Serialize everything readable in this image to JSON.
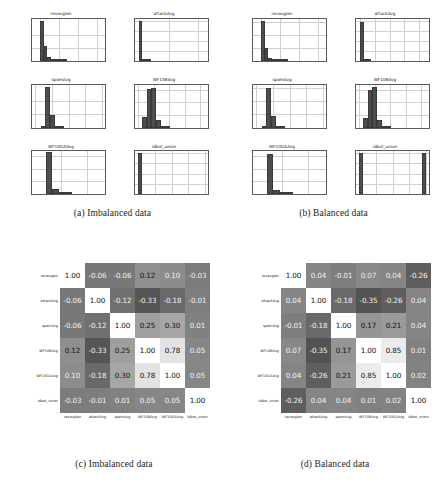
{
  "figure": {
    "background": "#ffffff",
    "bar_color": "#4d4d4d",
    "grid_color": "#d0d0d0",
    "axis_color": "#5a5a5a"
  },
  "panels": [
    {
      "id": "a",
      "caption": "(a) Imbalanced data"
    },
    {
      "id": "b",
      "caption": "(b) Balanced data"
    },
    {
      "id": "c",
      "caption": "(c) Imbalanced data"
    },
    {
      "id": "d",
      "caption": "(d) Balanced data"
    }
  ],
  "variables": [
    "revavglen",
    "attackAvg",
    "spamAvg",
    "WF10BAvg",
    "WF10GAAvg",
    "idbot_union"
  ],
  "chart_data": [
    {
      "id": "hist-imbalanced",
      "type": "bar",
      "title": "(a) Imbalanced data",
      "subplots": [
        {
          "title": "revavglen",
          "xlabel": "",
          "ylabel": "",
          "xlim": [
            -40000,
            340000
          ],
          "ylim": [
            0,
            32000
          ],
          "xticks": [
            0,
            100000,
            200000,
            300000
          ],
          "xticklabels": [
            "0",
            "100000",
            "200000",
            "300000"
          ],
          "yticks": [
            0,
            10000,
            20000
          ],
          "yticklabels": [
            "0",
            "10000",
            "20000"
          ],
          "bin_edges": [
            0,
            20000,
            40000,
            60000,
            80000,
            100000,
            120000,
            140000
          ],
          "values": [
            30000,
            11500,
            3000,
            1200,
            500,
            250,
            120
          ]
        },
        {
          "title": "attackAvg",
          "xlabel": "",
          "ylabel": "",
          "xlim": [
            -0.03,
            0.47
          ],
          "ylim": [
            0,
            42000
          ],
          "xticks": [
            0.0,
            0.2,
            0.4
          ],
          "xticklabels": [
            "0.0",
            "0.2",
            "0.4"
          ],
          "yticks": [
            0,
            10000,
            20000,
            30000,
            40000
          ],
          "yticklabels": [
            "0",
            "10000",
            "20000",
            "30000",
            "40000"
          ],
          "bin_edges": [
            0.0,
            0.02,
            0.04,
            0.06,
            0.08
          ],
          "values": [
            39500,
            900,
            200,
            80
          ]
        },
        {
          "title": "spamAvg",
          "xlabel": "",
          "ylabel": "",
          "xlim": [
            -0.05,
            1.05
          ],
          "ylim": [
            0,
            32000
          ],
          "xticks": [
            0.0,
            0.25,
            0.5,
            0.75,
            1.0
          ],
          "xticklabels": [
            "0.00",
            "0.25",
            "0.50",
            "0.75",
            "1.00"
          ],
          "yticks": [
            0,
            10000,
            20000
          ],
          "yticklabels": [
            "0",
            "10000",
            "20000"
          ],
          "bin_edges": [
            0.08,
            0.15,
            0.22,
            0.29,
            0.36,
            0.43
          ],
          "values": [
            1600,
            30500,
            9500,
            1400,
            300
          ]
        },
        {
          "title": "WF10BAvg",
          "xlabel": "",
          "ylabel": "",
          "xlim": [
            -0.04,
            0.9
          ],
          "ylim": [
            0,
            17000
          ],
          "xticks": [
            0.0,
            0.2,
            0.4,
            0.6,
            0.8
          ],
          "xticklabels": [
            "0.0",
            "0.2",
            "0.4",
            "0.6",
            "0.8"
          ],
          "yticks": [
            0,
            5000,
            10000,
            15000
          ],
          "yticklabels": [
            "0",
            "5000",
            "10000",
            "15000"
          ],
          "bin_edges": [
            0.05,
            0.11,
            0.17,
            0.23,
            0.29,
            0.35,
            0.41
          ],
          "values": [
            4200,
            15200,
            15800,
            3000,
            600,
            150
          ]
        },
        {
          "title": "WF10GAAvg",
          "xlabel": "",
          "ylabel": "",
          "xlim": [
            -0.0015,
            0.027
          ],
          "ylim": [
            0,
            34000
          ],
          "xticks": [
            0.01,
            0.02
          ],
          "xticklabels": [
            "0.01",
            "0.02"
          ],
          "yticks": [
            0,
            10000,
            20000,
            30000
          ],
          "yticklabels": [
            "0",
            "10000",
            "20000",
            "30000"
          ],
          "bin_edges": [
            0.004,
            0.0065,
            0.009,
            0.0115,
            0.014
          ],
          "values": [
            33000,
            3800,
            700,
            150
          ]
        },
        {
          "title": "idbot_union",
          "xlabel": "",
          "ylabel": "",
          "xlim": [
            -0.05,
            1.05
          ],
          "ylim": [
            0,
            42000
          ],
          "xticks": [
            0.0,
            0.25,
            0.5,
            0.75,
            1.0
          ],
          "xticklabels": [
            "0.00",
            "0.25",
            "0.50",
            "0.75",
            "1.00"
          ],
          "yticks": [
            0,
            10000,
            20000,
            30000,
            40000
          ],
          "yticklabels": [
            "0",
            "10000",
            "20000",
            "30000",
            "40000"
          ],
          "bin_edges": [
            0.0,
            0.05
          ],
          "values": [
            40000
          ]
        }
      ]
    },
    {
      "id": "hist-balanced",
      "type": "bar",
      "title": "(b) Balanced data",
      "subplots": [
        {
          "title": "revavglen",
          "xlabel": "",
          "ylabel": "",
          "xlim": [
            -40000,
            340000
          ],
          "ylim": [
            0,
            33000
          ],
          "xticks": [
            0,
            100000,
            200000,
            300000
          ],
          "xticklabels": [
            "0",
            "100000",
            "200000",
            "300000"
          ],
          "yticks": [
            0,
            10000,
            20000,
            30000
          ],
          "yticklabels": [
            "0",
            "10000",
            "20000",
            "30000"
          ],
          "bin_edges": [
            0,
            20000,
            40000,
            60000,
            80000,
            100000,
            120000,
            140000
          ],
          "values": [
            31000,
            10500,
            2800,
            1100,
            500,
            250,
            120
          ]
        },
        {
          "title": "attackAvg",
          "xlabel": "",
          "ylabel": "",
          "xlim": [
            -0.03,
            0.47
          ],
          "ylim": [
            0,
            42000
          ],
          "xticks": [
            0.0,
            0.1,
            0.2,
            0.3,
            0.4
          ],
          "xticklabels": [
            "0.0",
            "0.1",
            "0.2",
            "0.3",
            "0.4"
          ],
          "yticks": [
            0,
            10000,
            20000,
            30000,
            40000
          ],
          "yticklabels": [
            "0",
            "10000",
            "20000",
            "30000",
            "40000"
          ],
          "bin_edges": [
            0.0,
            0.025,
            0.05,
            0.075
          ],
          "values": [
            39000,
            1100,
            250
          ]
        },
        {
          "title": "spamAvg",
          "xlabel": "",
          "ylabel": "",
          "xlim": [
            -0.05,
            1.05
          ],
          "ylim": [
            0,
            32000
          ],
          "xticks": [
            0.0,
            0.25,
            0.5,
            0.75,
            1.0
          ],
          "xticklabels": [
            "0.00",
            "0.25",
            "0.50",
            "0.75",
            "1.00"
          ],
          "yticks": [
            0,
            10000,
            20000,
            30000
          ],
          "yticklabels": [
            "0",
            "10000",
            "20000",
            "30000"
          ],
          "bin_edges": [
            0.08,
            0.15,
            0.22,
            0.29,
            0.36,
            0.43
          ],
          "values": [
            1500,
            30000,
            9000,
            1300,
            280
          ]
        },
        {
          "title": "WF10BAvg",
          "xlabel": "",
          "ylabel": "",
          "xlim": [
            -0.04,
            0.9
          ],
          "ylim": [
            0,
            17000
          ],
          "xticks": [
            0.0,
            0.2,
            0.4,
            0.6,
            0.8
          ],
          "xticklabels": [
            "0.0",
            "0.2",
            "0.4",
            "0.6",
            "0.8"
          ],
          "yticks": [
            0,
            5000,
            10000,
            15000
          ],
          "yticklabels": [
            "0",
            "5000",
            "10000",
            "15000"
          ],
          "bin_edges": [
            0.05,
            0.11,
            0.17,
            0.23,
            0.29,
            0.35,
            0.41
          ],
          "values": [
            4000,
            14800,
            16000,
            3200,
            700,
            150
          ]
        },
        {
          "title": "WF10GAAvg",
          "xlabel": "",
          "ylabel": "",
          "xlim": [
            -0.0015,
            0.027
          ],
          "ylim": [
            0,
            34000
          ],
          "xticks": [
            0.01,
            0.02
          ],
          "xticklabels": [
            "0.01",
            "0.02"
          ],
          "yticks": [
            0,
            10000,
            20000,
            30000
          ],
          "yticklabels": [
            "0",
            "10000",
            "20000",
            "30000"
          ],
          "bin_edges": [
            0.004,
            0.0065,
            0.009,
            0.0115,
            0.014
          ],
          "values": [
            32000,
            3500,
            600,
            120
          ]
        },
        {
          "title": "idbot_union",
          "xlabel": "",
          "ylabel": "",
          "xlim": [
            -0.05,
            1.05
          ],
          "ylim": [
            0,
            21000
          ],
          "xticks": [
            0.0,
            0.25,
            0.5,
            0.75,
            1.0
          ],
          "xticklabels": [
            "0.00",
            "0.25",
            "0.50",
            "0.75",
            "1.00"
          ],
          "yticks": [
            0,
            5000,
            10000,
            15000,
            20000
          ],
          "yticklabels": [
            "0",
            "5000",
            "10000",
            "15000",
            "20000"
          ],
          "bin_edges": [
            0.0,
            0.05,
            0.95,
            1.0
          ],
          "values": [
            20000,
            0,
            20000
          ]
        }
      ]
    },
    {
      "id": "corr-imbalanced",
      "type": "heatmap",
      "title": "(c) Imbalanced data",
      "colormap": "gray",
      "vmin": -1.0,
      "vmax": 1.0,
      "xlabels": [
        "revavglen",
        "attackAvg",
        "spamAvg",
        "WF10BAvg",
        "WF10GAAvg",
        "idbot_union"
      ],
      "ylabels": [
        "revavglen",
        "attackAvg",
        "spamAvg",
        "WF10BAvg",
        "WF10GAAvg",
        "idbot_union"
      ],
      "matrix": [
        [
          1.0,
          -0.06,
          -0.06,
          0.12,
          0.1,
          -0.03
        ],
        [
          -0.06,
          1.0,
          -0.12,
          -0.33,
          -0.18,
          -0.01
        ],
        [
          -0.06,
          -0.12,
          1.0,
          0.25,
          0.3,
          0.01
        ],
        [
          0.12,
          -0.33,
          0.25,
          1.0,
          0.78,
          0.05
        ],
        [
          0.1,
          -0.18,
          0.3,
          0.78,
          1.0,
          0.05
        ],
        [
          -0.03,
          -0.01,
          0.01,
          0.05,
          0.05,
          1.0
        ]
      ]
    },
    {
      "id": "corr-balanced",
      "type": "heatmap",
      "title": "(d) Balanced data",
      "colormap": "gray",
      "vmin": -1.0,
      "vmax": 1.0,
      "xlabels": [
        "revavglen",
        "attackAvg",
        "spamAvg",
        "WF10BAvg",
        "WF10GAAvg",
        "idbot_union"
      ],
      "ylabels": [
        "revavglen",
        "attackAvg",
        "spamAvg",
        "WF10BAvg",
        "WF10GAAvg",
        "idbot_union"
      ],
      "matrix": [
        [
          1.0,
          0.04,
          -0.01,
          0.07,
          0.04,
          -0.26
        ],
        [
          0.04,
          1.0,
          -0.18,
          -0.35,
          -0.26,
          0.04
        ],
        [
          -0.01,
          -0.18,
          1.0,
          0.17,
          0.21,
          0.04
        ],
        [
          0.07,
          -0.35,
          0.17,
          1.0,
          0.85,
          0.01
        ],
        [
          0.04,
          -0.26,
          0.21,
          0.85,
          1.0,
          0.02
        ],
        [
          -0.26,
          0.04,
          0.04,
          0.01,
          0.02,
          1.0
        ]
      ]
    }
  ]
}
